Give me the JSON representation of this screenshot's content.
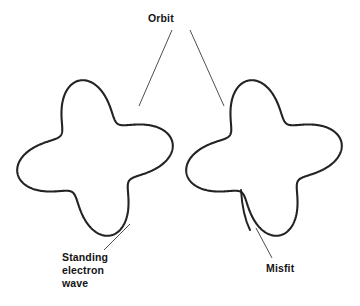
{
  "diagram": {
    "background_color": "#ffffff",
    "stroke_color": "#232323",
    "text_color": "#141414"
  },
  "labels": {
    "orbit": "Orbit",
    "standing_electron_wave": "Standing\nelectron\nwave",
    "standing_line_1": "Standing",
    "standing_line_2": "electron",
    "standing_line_3": "wave",
    "misfit": "Misfit"
  },
  "figures": [
    {
      "id": "left-figure",
      "name": "closed-standing-wave-orbit",
      "description": "Circular orbit with a standing electron wave of a whole number of wavelengths; the wave joins itself smoothly.",
      "center": {
        "x": 95,
        "y": 158
      },
      "mean_radius": 60,
      "wave_amplitude": 19,
      "wave_cycles": 4,
      "phase_deg": 45,
      "closed": true
    },
    {
      "id": "right-figure",
      "name": "misfit-standing-wave-orbit",
      "description": "Circular orbit with a non-integral number of wavelengths; the wave ends overlap and do not join, producing a misfit.",
      "center": {
        "x": 264,
        "y": 158
      },
      "mean_radius": 60,
      "wave_amplitude": 19,
      "wave_cycles": 4,
      "phase_deg": 45,
      "closed": false,
      "misfit_point": {
        "x": 256,
        "y": 228
      }
    }
  ],
  "leaders": [
    {
      "name": "orbit-to-left-figure",
      "from": {
        "x": 172,
        "y": 30
      },
      "to": {
        "x": 139,
        "y": 106
      }
    },
    {
      "name": "orbit-to-right-figure",
      "from": {
        "x": 190,
        "y": 30
      },
      "to": {
        "x": 224,
        "y": 106
      }
    },
    {
      "name": "standing-wave-to-left-figure",
      "from": {
        "x": 104,
        "y": 250
      },
      "to": {
        "x": 130,
        "y": 224
      }
    },
    {
      "name": "misfit-to-right-figure",
      "from": {
        "x": 272,
        "y": 258
      },
      "to": {
        "x": 256,
        "y": 228
      }
    }
  ]
}
